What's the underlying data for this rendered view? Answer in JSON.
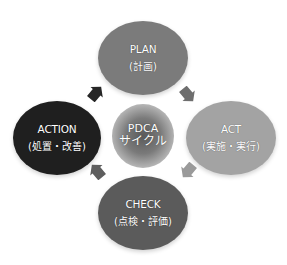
{
  "diagram": {
    "type": "cycle",
    "center": {
      "line1": "PDCA",
      "line2": "サイクル",
      "gradient_inner": "#555555",
      "gradient_outer": "#f2f2f2"
    },
    "nodes": [
      {
        "id": "plan",
        "title": "PLAN",
        "subtitle": "(計画)",
        "color": "#7b7b7b"
      },
      {
        "id": "act",
        "title": "ACT",
        "subtitle": "(実施・実行)",
        "color": "#a3a3a3"
      },
      {
        "id": "check",
        "title": "CHECK",
        "subtitle": "(点検・評価)",
        "color": "#5b5b5b"
      },
      {
        "id": "action",
        "title": "ACTION",
        "subtitle": "(処置・改善)",
        "color": "#1f1f1f"
      }
    ],
    "arrows": [
      {
        "from": "plan",
        "to": "act",
        "color": "#6e6e6e",
        "direction": "down-right"
      },
      {
        "from": "act",
        "to": "check",
        "color": "#9a9a9a",
        "direction": "down-left"
      },
      {
        "from": "check",
        "to": "action",
        "color": "#5e5e5e",
        "direction": "up-left"
      },
      {
        "from": "action",
        "to": "plan",
        "color": "#262626",
        "direction": "up-right"
      }
    ]
  }
}
